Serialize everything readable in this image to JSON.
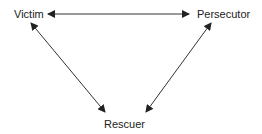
{
  "diagram": {
    "title": "",
    "nodes": [
      {
        "id": "victim",
        "label": "Victim"
      },
      {
        "id": "persecutor",
        "label": "Persecutor"
      },
      {
        "id": "rescuer",
        "label": "Rescuer"
      }
    ],
    "edges": [
      {
        "from": "victim",
        "to": "persecutor",
        "direction": "both"
      },
      {
        "from": "victim",
        "to": "rescuer",
        "direction": "both"
      },
      {
        "from": "persecutor",
        "to": "rescuer",
        "direction": "both"
      }
    ],
    "colors": {
      "line": "#333333",
      "text": "#222222",
      "background": "#ffffff"
    }
  }
}
